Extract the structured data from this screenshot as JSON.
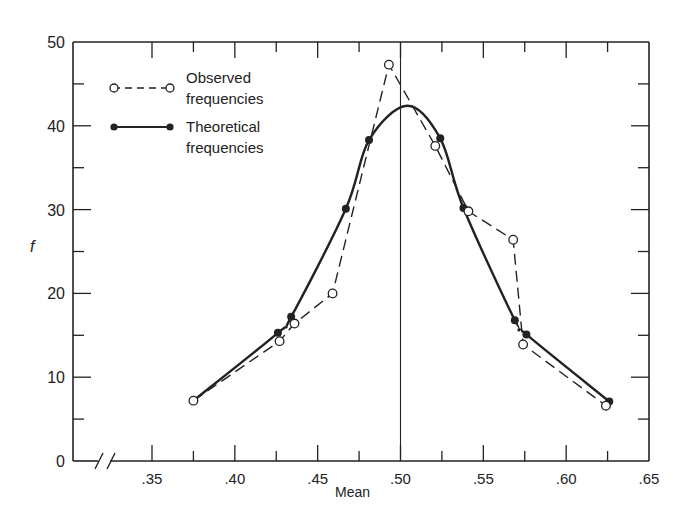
{
  "chart_data": {
    "type": "line",
    "title": "",
    "xlabel": "Mean",
    "ylabel": "f",
    "xlim": [
      0.3,
      0.65
    ],
    "ylim": [
      0,
      50
    ],
    "x_ticks": [
      0.35,
      0.4,
      0.45,
      0.5,
      0.55,
      0.6,
      0.65
    ],
    "x_tick_labels": [
      ".35",
      ".40",
      ".45",
      ".50",
      ".55",
      ".60",
      ".65"
    ],
    "y_ticks": [
      0,
      10,
      20,
      30,
      40,
      50
    ],
    "y_tick_labels": [
      "0",
      "10",
      "20",
      "30",
      "40",
      "50"
    ],
    "axis_break": true,
    "grid": false,
    "reference_line_x": 0.5,
    "legend_position": "upper-left",
    "series": [
      {
        "name": "Observed frequencies",
        "style": "dashed",
        "marker": "open-circle",
        "x": [
          0.375,
          0.427,
          0.436,
          0.459,
          0.493,
          0.521,
          0.541,
          0.568,
          0.574,
          0.624
        ],
        "y": [
          7.2,
          14.3,
          16.4,
          20.0,
          47.3,
          37.6,
          29.8,
          26.4,
          13.9,
          6.6
        ]
      },
      {
        "name": "Theoretical frequencies",
        "style": "solid-smooth",
        "marker": "filled-circle",
        "x": [
          0.375,
          0.426,
          0.434,
          0.467,
          0.481,
          0.524,
          0.538,
          0.569,
          0.576,
          0.626
        ],
        "y": [
          7.2,
          15.3,
          17.2,
          30.1,
          38.3,
          38.5,
          30.2,
          16.8,
          15.1,
          7.1
        ],
        "peak": {
          "x": 0.504,
          "y": 42.4
        }
      }
    ]
  },
  "legend": {
    "observed_line1": "Observed",
    "observed_line2": "frequencies",
    "theoretical_line1": "Theoretical",
    "theoretical_line2": "frequencies"
  },
  "axes": {
    "xlabel": "Mean",
    "ylabel": "f"
  }
}
